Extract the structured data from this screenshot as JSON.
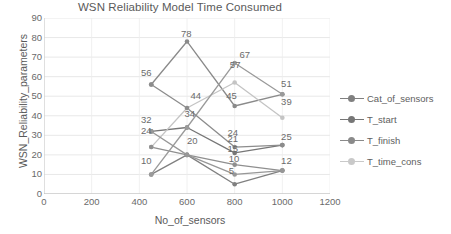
{
  "chart_data": {
    "type": "line",
    "title": "WSN Reliability Model Time Consumed",
    "xlabel": "No_of_sensors",
    "ylabel": "WSN_Reliability_parameters",
    "xlim": [
      0,
      1200
    ],
    "ylim": [
      0,
      90
    ],
    "xticks": [
      0,
      200,
      400,
      600,
      800,
      1000,
      1200
    ],
    "yticks": [
      0,
      10,
      20,
      30,
      40,
      50,
      60,
      70,
      80,
      90
    ],
    "grid": true,
    "legend_position": "right",
    "x": [
      450,
      600,
      800,
      1000
    ],
    "series": [
      {
        "name": "Cat_of_sensors",
        "color": "#808080",
        "values": [
          10,
          20,
          5,
          12
        ],
        "labels": [
          "10",
          "20",
          "5",
          "12"
        ]
      },
      {
        "name": "T_start",
        "color": "#767676",
        "values": [
          32,
          34,
          21,
          25
        ],
        "labels": [
          "32",
          "34",
          "21",
          "25"
        ]
      },
      {
        "name": "T_finish",
        "color": "#8a8a8a",
        "values": [
          56,
          78,
          45,
          51
        ],
        "labels": [
          "56",
          "78",
          "45",
          "51"
        ]
      },
      {
        "name": "T_time_cons",
        "color": "#c4c4c4",
        "values": [
          24,
          44,
          57,
          39
        ],
        "labels": [
          "24",
          "44",
          "57",
          "39"
        ]
      },
      {
        "name": "extra_lower",
        "color": "#8f8f8f",
        "values": [
          24,
          20,
          15,
          12
        ],
        "labels": [
          "24",
          "20",
          "15",
          "12"
        ]
      },
      {
        "name": "extra_mid",
        "color": "#9a9a9a",
        "values": [
          10,
          34,
          67,
          51
        ],
        "labels": [
          "10",
          "34",
          "67",
          "51"
        ]
      },
      {
        "name": "extra_high",
        "color": "#8c8c8c",
        "values": [
          56,
          44,
          24,
          25
        ],
        "labels": [
          "56",
          "44",
          "24",
          "25"
        ]
      },
      {
        "name": "extra_low2",
        "color": "#979797",
        "values": [
          32,
          20,
          10,
          12
        ],
        "labels": [
          "32",
          "20",
          "10",
          "12"
        ]
      }
    ],
    "data_labels": [
      {
        "text": "78",
        "x": 600,
        "y": 82
      },
      {
        "text": "67",
        "x": 845,
        "y": 71
      },
      {
        "text": "56",
        "x": 432,
        "y": 62
      },
      {
        "text": "57",
        "x": 805,
        "y": 66
      },
      {
        "text": "51",
        "x": 1020,
        "y": 56
      },
      {
        "text": "45",
        "x": 790,
        "y": 50
      },
      {
        "text": "44",
        "x": 640,
        "y": 50
      },
      {
        "text": "39",
        "x": 1020,
        "y": 47
      },
      {
        "text": "34",
        "x": 615,
        "y": 41
      },
      {
        "text": "32",
        "x": 432,
        "y": 38
      },
      {
        "text": "25",
        "x": 1020,
        "y": 29
      },
      {
        "text": "24",
        "x": 432,
        "y": 32
      },
      {
        "text": "24",
        "x": 795,
        "y": 31
      },
      {
        "text": "21",
        "x": 795,
        "y": 28
      },
      {
        "text": "20",
        "x": 625,
        "y": 27
      },
      {
        "text": "15",
        "x": 795,
        "y": 23
      },
      {
        "text": "12",
        "x": 1020,
        "y": 17
      },
      {
        "text": "10",
        "x": 432,
        "y": 17
      },
      {
        "text": "10",
        "x": 800,
        "y": 18
      },
      {
        "text": "5",
        "x": 800,
        "y": 12
      }
    ]
  },
  "legend": {
    "items": [
      {
        "label": "Cat_of_sensors",
        "color": "#808080"
      },
      {
        "label": "T_start",
        "color": "#767676"
      },
      {
        "label": "T_finish",
        "color": "#8a8a8a"
      },
      {
        "label": "T_time_cons",
        "color": "#c9c9c9"
      }
    ]
  }
}
